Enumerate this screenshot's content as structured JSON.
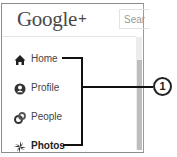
{
  "header": {
    "logo_text": "Google",
    "logo_plus": "+",
    "search_placeholder": "Sear"
  },
  "sidebar": {
    "items": [
      {
        "label": "Home",
        "icon": "home-icon",
        "active": false
      },
      {
        "label": "Profile",
        "icon": "profile-icon",
        "active": false
      },
      {
        "label": "People",
        "icon": "people-icon",
        "active": false
      },
      {
        "label": "Photos",
        "icon": "photos-icon",
        "active": true
      }
    ]
  },
  "callout": {
    "number": "1"
  },
  "colors": {
    "border": "#8c8c8c",
    "text": "#444444",
    "callout_line": "#111111"
  }
}
